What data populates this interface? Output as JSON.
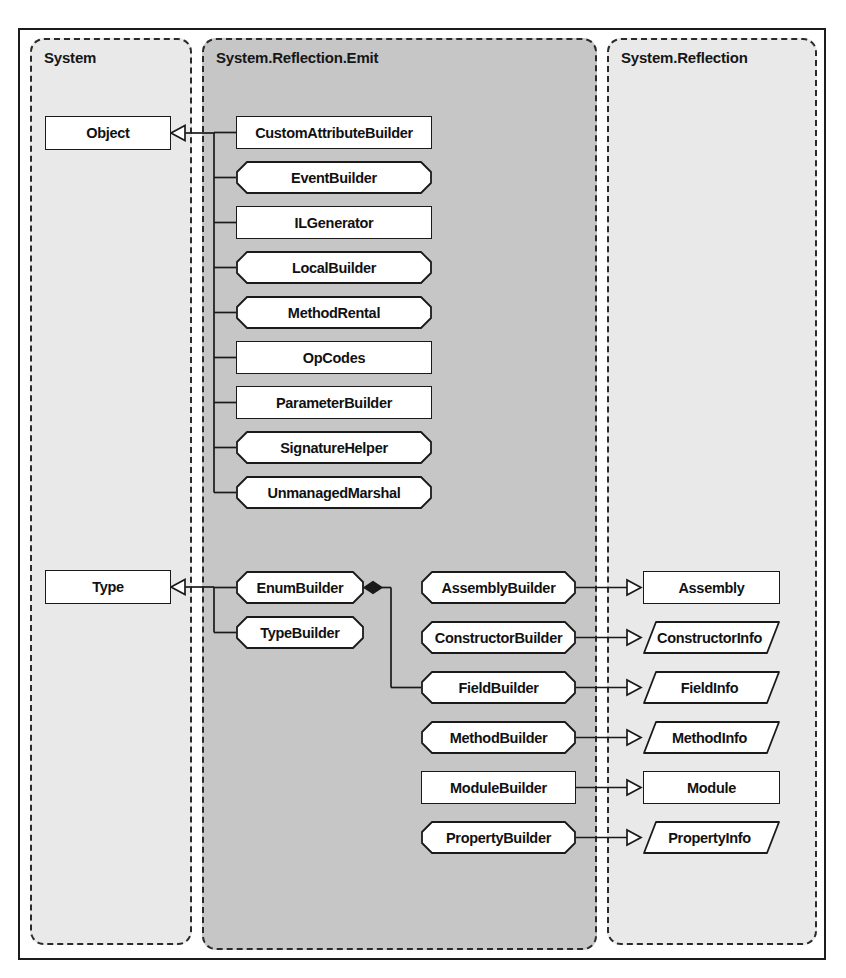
{
  "diagram": {
    "colors": {
      "page_background": "#ffffff",
      "frame_border": "#1c1c1c",
      "package_border": "#2a2a2a",
      "package_light_fill": "#e8e8e8",
      "package_dark_fill": "#c6c6c6",
      "node_fill": "#ffffff",
      "node_border": "#1a1a1a",
      "connector": "#1a1a1a"
    }
  },
  "packages": [
    {
      "id": "system",
      "label": "System",
      "fill": "#e9e9e9"
    },
    {
      "id": "system_reflection_emit",
      "label": "System.Reflection.Emit",
      "fill": "#c6c6c6"
    },
    {
      "id": "system_reflection",
      "label": "System.Reflection",
      "fill": "#e9e9e9"
    }
  ],
  "nodes": {
    "system": [
      {
        "id": "object",
        "label": "Object",
        "shape": "rect"
      },
      {
        "id": "type",
        "label": "Type",
        "shape": "rect"
      }
    ],
    "emit_object_descendants": [
      {
        "id": "custom_attribute_builder",
        "label": "CustomAttributeBuilder",
        "shape": "rect"
      },
      {
        "id": "event_builder",
        "label": "EventBuilder",
        "shape": "chamfer"
      },
      {
        "id": "il_generator",
        "label": "ILGenerator",
        "shape": "rect"
      },
      {
        "id": "local_builder",
        "label": "LocalBuilder",
        "shape": "chamfer"
      },
      {
        "id": "method_rental",
        "label": "MethodRental",
        "shape": "chamfer"
      },
      {
        "id": "op_codes",
        "label": "OpCodes",
        "shape": "rect"
      },
      {
        "id": "parameter_builder",
        "label": "ParameterBuilder",
        "shape": "rect"
      },
      {
        "id": "signature_helper",
        "label": "SignatureHelper",
        "shape": "chamfer"
      },
      {
        "id": "unmanaged_marshal",
        "label": "UnmanagedMarshal",
        "shape": "chamfer"
      }
    ],
    "emit_type_descendants": [
      {
        "id": "enum_builder",
        "label": "EnumBuilder",
        "shape": "chamfer"
      },
      {
        "id": "type_builder",
        "label": "TypeBuilder",
        "shape": "chamfer"
      }
    ],
    "emit_reflection_builders": [
      {
        "id": "assembly_builder",
        "label": "AssemblyBuilder",
        "shape": "chamfer"
      },
      {
        "id": "constructor_builder",
        "label": "ConstructorBuilder",
        "shape": "chamfer"
      },
      {
        "id": "field_builder",
        "label": "FieldBuilder",
        "shape": "chamfer"
      },
      {
        "id": "method_builder",
        "label": "MethodBuilder",
        "shape": "chamfer"
      },
      {
        "id": "module_builder",
        "label": "ModuleBuilder",
        "shape": "rect"
      },
      {
        "id": "property_builder",
        "label": "PropertyBuilder",
        "shape": "chamfer"
      }
    ],
    "reflection": [
      {
        "id": "assembly",
        "label": "Assembly",
        "shape": "rect"
      },
      {
        "id": "constructor_info",
        "label": "ConstructorInfo",
        "shape": "para"
      },
      {
        "id": "field_info",
        "label": "FieldInfo",
        "shape": "para"
      },
      {
        "id": "method_info",
        "label": "MethodInfo",
        "shape": "para"
      },
      {
        "id": "module",
        "label": "Module",
        "shape": "rect"
      },
      {
        "id": "property_info",
        "label": "PropertyInfo",
        "shape": "para"
      }
    ]
  },
  "relationships": [
    {
      "type": "generalization",
      "from": "custom_attribute_builder",
      "to": "object"
    },
    {
      "type": "generalization",
      "from": "event_builder",
      "to": "object"
    },
    {
      "type": "generalization",
      "from": "il_generator",
      "to": "object"
    },
    {
      "type": "generalization",
      "from": "local_builder",
      "to": "object"
    },
    {
      "type": "generalization",
      "from": "method_rental",
      "to": "object"
    },
    {
      "type": "generalization",
      "from": "op_codes",
      "to": "object"
    },
    {
      "type": "generalization",
      "from": "parameter_builder",
      "to": "object"
    },
    {
      "type": "generalization",
      "from": "signature_helper",
      "to": "object"
    },
    {
      "type": "generalization",
      "from": "unmanaged_marshal",
      "to": "object"
    },
    {
      "type": "generalization",
      "from": "enum_builder",
      "to": "type"
    },
    {
      "type": "generalization",
      "from": "type_builder",
      "to": "type"
    },
    {
      "type": "composition",
      "from": "enum_builder",
      "to": "field_builder"
    },
    {
      "type": "generalization",
      "from": "assembly_builder",
      "to": "assembly"
    },
    {
      "type": "generalization",
      "from": "constructor_builder",
      "to": "constructor_info"
    },
    {
      "type": "generalization",
      "from": "field_builder",
      "to": "field_info"
    },
    {
      "type": "generalization",
      "from": "method_builder",
      "to": "method_info"
    },
    {
      "type": "generalization",
      "from": "module_builder",
      "to": "module"
    },
    {
      "type": "generalization",
      "from": "property_builder",
      "to": "property_info"
    }
  ],
  "geometry": {
    "packages": {
      "system": {
        "x": 30,
        "y": 38,
        "w": 162,
        "h": 907
      },
      "system_reflection_emit": {
        "x": 202,
        "y": 38,
        "w": 395,
        "h": 912
      },
      "system_reflection": {
        "x": 607,
        "y": 38,
        "w": 210,
        "h": 907
      }
    },
    "nodes": {
      "object": {
        "x": 45,
        "y": 116,
        "w": 126,
        "h": 34
      },
      "type": {
        "x": 45,
        "y": 570,
        "w": 126,
        "h": 34
      },
      "custom_attribute_builder": {
        "x": 236,
        "y": 116,
        "w": 196,
        "h": 33
      },
      "event_builder": {
        "x": 236,
        "y": 161,
        "w": 196,
        "h": 33
      },
      "il_generator": {
        "x": 236,
        "y": 206,
        "w": 196,
        "h": 33
      },
      "local_builder": {
        "x": 236,
        "y": 251,
        "w": 196,
        "h": 33
      },
      "method_rental": {
        "x": 236,
        "y": 296,
        "w": 196,
        "h": 33
      },
      "op_codes": {
        "x": 236,
        "y": 341,
        "w": 196,
        "h": 33
      },
      "parameter_builder": {
        "x": 236,
        "y": 386,
        "w": 196,
        "h": 33
      },
      "signature_helper": {
        "x": 236,
        "y": 431,
        "w": 196,
        "h": 33
      },
      "unmanaged_marshal": {
        "x": 236,
        "y": 476,
        "w": 196,
        "h": 33
      },
      "enum_builder": {
        "x": 236,
        "y": 571,
        "w": 128,
        "h": 33
      },
      "type_builder": {
        "x": 236,
        "y": 616,
        "w": 128,
        "h": 33
      },
      "assembly_builder": {
        "x": 421,
        "y": 571,
        "w": 155,
        "h": 33
      },
      "constructor_builder": {
        "x": 421,
        "y": 621,
        "w": 155,
        "h": 33
      },
      "field_builder": {
        "x": 421,
        "y": 671,
        "w": 155,
        "h": 33
      },
      "method_builder": {
        "x": 421,
        "y": 721,
        "w": 155,
        "h": 33
      },
      "module_builder": {
        "x": 421,
        "y": 771,
        "w": 155,
        "h": 33
      },
      "property_builder": {
        "x": 421,
        "y": 821,
        "w": 155,
        "h": 33
      },
      "assembly": {
        "x": 643,
        "y": 571,
        "w": 137,
        "h": 33
      },
      "constructor_info": {
        "x": 643,
        "y": 621,
        "w": 137,
        "h": 33
      },
      "field_info": {
        "x": 643,
        "y": 671,
        "w": 137,
        "h": 33
      },
      "method_info": {
        "x": 643,
        "y": 721,
        "w": 137,
        "h": 33
      },
      "module": {
        "x": 643,
        "y": 771,
        "w": 137,
        "h": 33
      },
      "property_info": {
        "x": 643,
        "y": 821,
        "w": 137,
        "h": 33
      }
    }
  }
}
